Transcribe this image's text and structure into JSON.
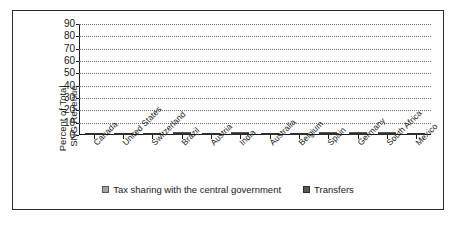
{
  "chart_data": {
    "type": "bar",
    "subtype": "stacked-vertical",
    "title": "",
    "xlabel": "",
    "ylabel": "Percent of Total SNG Revenue",
    "ylabel_lines": [
      "Percent of Total",
      "SNG Revenue"
    ],
    "ylim": [
      0,
      90
    ],
    "ytick_values": [
      0,
      10,
      20,
      30,
      40,
      50,
      60,
      70,
      80,
      90
    ],
    "ytick_labels": [
      "0",
      "10",
      "20",
      "30",
      "40",
      "50",
      "60",
      "70",
      "80",
      "90"
    ],
    "grid": true,
    "grid_style": "dotted-horizontal",
    "legend_position": "bottom-center",
    "categories": [
      "Canada",
      "United States",
      "Switzerland",
      "Brazil",
      "Austria",
      "India",
      "Australia",
      "Belgium",
      "Spain",
      "Germany",
      "South Africa",
      "Mexico"
    ],
    "series": [
      {
        "name": "Transfers",
        "color": "#595959",
        "values": [
          13,
          18,
          18,
          14,
          32,
          17,
          42,
          61,
          46,
          14,
          14,
          84
        ]
      },
      {
        "name": "Tax sharing with the central government",
        "color": "#a3a3a3",
        "values": [
          0,
          0,
          0,
          12,
          0,
          23,
          0,
          0,
          16,
          51,
          58,
          0
        ]
      }
    ],
    "totals": [
      13,
      18,
      18,
      26,
      32,
      40,
      42,
      61,
      62,
      65,
      72,
      84
    ],
    "stack_order": [
      "Transfers",
      "Tax sharing with the central government"
    ]
  },
  "legend": {
    "items": [
      {
        "label": "Tax sharing with the central government",
        "swatch": "legend-swatch-tax-sharing"
      },
      {
        "label": "Transfers",
        "swatch": "legend-swatch-transfers"
      }
    ]
  },
  "colors": {
    "tax_sharing": "#a3a3a3",
    "transfers": "#595959",
    "axis": "#1a1a1a",
    "grid": "#6e6e6e",
    "border": "#2a2a2a",
    "background": "#ffffff"
  }
}
